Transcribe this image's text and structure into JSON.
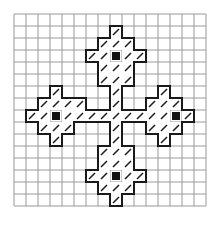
{
  "diagram": {
    "type": "stitch-pattern-grid",
    "grid": {
      "cols": 16,
      "rows": 16,
      "cell": 12,
      "origin_x": 14,
      "origin_y": 14,
      "line_color": "#9a9a9a"
    },
    "colors": {
      "outline": "#1a1a1a",
      "hatch": "#222222",
      "filled": "#111111",
      "background": "#ffffff"
    },
    "hatched_cells": [
      [
        8,
        1
      ],
      [
        7,
        2
      ],
      [
        8,
        2
      ],
      [
        9,
        2
      ],
      [
        6,
        3
      ],
      [
        7,
        3
      ],
      [
        9,
        3
      ],
      [
        10,
        3
      ],
      [
        7,
        4
      ],
      [
        8,
        4
      ],
      [
        9,
        4
      ],
      [
        7,
        5
      ],
      [
        8,
        5
      ],
      [
        9,
        5
      ],
      [
        8,
        6
      ],
      [
        8,
        7
      ],
      [
        3,
        6
      ],
      [
        12,
        6
      ],
      [
        2,
        7
      ],
      [
        3,
        7
      ],
      [
        4,
        7
      ],
      [
        5,
        7
      ],
      [
        11,
        7
      ],
      [
        12,
        7
      ],
      [
        13,
        7
      ],
      [
        1,
        8
      ],
      [
        2,
        8
      ],
      [
        4,
        8
      ],
      [
        5,
        8
      ],
      [
        6,
        8
      ],
      [
        7,
        8
      ],
      [
        8,
        8
      ],
      [
        9,
        8
      ],
      [
        10,
        8
      ],
      [
        11,
        8
      ],
      [
        12,
        8
      ],
      [
        14,
        8
      ],
      [
        2,
        9
      ],
      [
        3,
        9
      ],
      [
        4,
        9
      ],
      [
        11,
        9
      ],
      [
        12,
        9
      ],
      [
        13,
        9
      ],
      [
        3,
        10
      ],
      [
        12,
        10
      ],
      [
        8,
        9
      ],
      [
        8,
        10
      ],
      [
        7,
        11
      ],
      [
        8,
        11
      ],
      [
        9,
        11
      ],
      [
        7,
        12
      ],
      [
        8,
        12
      ],
      [
        9,
        12
      ],
      [
        6,
        13
      ],
      [
        7,
        13
      ],
      [
        9,
        13
      ],
      [
        10,
        13
      ],
      [
        7,
        14
      ],
      [
        8,
        14
      ],
      [
        9,
        14
      ],
      [
        8,
        15
      ]
    ],
    "filled_cells": [
      [
        8,
        3
      ],
      [
        3,
        8
      ],
      [
        13,
        8
      ],
      [
        8,
        13
      ]
    ],
    "motifs": [
      "top",
      "left",
      "right",
      "bottom"
    ]
  }
}
